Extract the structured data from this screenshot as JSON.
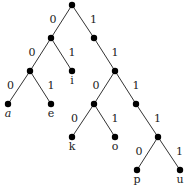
{
  "diagram": {
    "type": "binary-trie",
    "nodes": [
      {
        "id": "n0",
        "x": 72,
        "y": 5
      },
      {
        "id": "n1",
        "x": 51,
        "y": 38
      },
      {
        "id": "n2",
        "x": 94,
        "y": 38
      },
      {
        "id": "n3",
        "x": 30,
        "y": 71
      },
      {
        "id": "i",
        "x": 72,
        "y": 71,
        "label": "i"
      },
      {
        "id": "n5",
        "x": 115,
        "y": 71
      },
      {
        "id": "a",
        "x": 8,
        "y": 104,
        "label": "a"
      },
      {
        "id": "e",
        "x": 51,
        "y": 104,
        "label": "e"
      },
      {
        "id": "n8",
        "x": 94,
        "y": 104
      },
      {
        "id": "n9",
        "x": 136,
        "y": 104
      },
      {
        "id": "k",
        "x": 72,
        "y": 137,
        "label": "k"
      },
      {
        "id": "o",
        "x": 115,
        "y": 137,
        "label": "o"
      },
      {
        "id": "n12",
        "x": 158,
        "y": 137
      },
      {
        "id": "p",
        "x": 137,
        "y": 170,
        "label": "p"
      },
      {
        "id": "u",
        "x": 180,
        "y": 170,
        "label": "u"
      }
    ],
    "edges": [
      {
        "from": "n0",
        "to": "n1",
        "bit": "0"
      },
      {
        "from": "n0",
        "to": "n2",
        "bit": "1"
      },
      {
        "from": "n1",
        "to": "n3",
        "bit": "0"
      },
      {
        "from": "n1",
        "to": "i",
        "bit": "1"
      },
      {
        "from": "n2",
        "to": "n5",
        "bit": "1"
      },
      {
        "from": "n3",
        "to": "a",
        "bit": "0"
      },
      {
        "from": "n3",
        "to": "e",
        "bit": "1"
      },
      {
        "from": "n5",
        "to": "n8",
        "bit": "0"
      },
      {
        "from": "n5",
        "to": "n9",
        "bit": "1"
      },
      {
        "from": "n8",
        "to": "k",
        "bit": "0"
      },
      {
        "from": "n8",
        "to": "o",
        "bit": "1"
      },
      {
        "from": "n9",
        "to": "n12",
        "bit": "1"
      },
      {
        "from": "n12",
        "to": "p",
        "bit": "0"
      },
      {
        "from": "n12",
        "to": "u",
        "bit": "1"
      }
    ]
  }
}
